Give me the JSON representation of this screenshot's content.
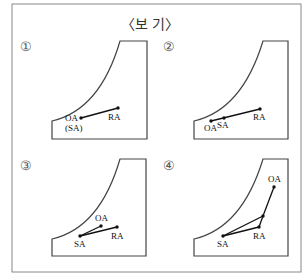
{
  "title": "〈보 기〉",
  "panels": [
    {
      "number": "①",
      "labels": {
        "oa": "OA",
        "sa": "(SA)",
        "ra": "RA"
      },
      "points": {
        "OA": [
          81,
          118
        ],
        "RA": [
          118,
          108
        ]
      }
    },
    {
      "number": "②",
      "labels": {
        "oa": "OA",
        "sa": "SA",
        "ra": "RA"
      },
      "points": {
        "OA": [
          211,
          121
        ],
        "SA": [
          224,
          118
        ],
        "RA": [
          260,
          109
        ]
      }
    },
    {
      "number": "③",
      "labels": {
        "oa": "OA",
        "sa": "SA",
        "ra": "RA"
      },
      "points": {
        "SA": [
          80,
          236
        ],
        "OA": [
          101,
          226
        ],
        "RA": [
          117,
          227
        ]
      }
    },
    {
      "number": "④",
      "labels": {
        "oa": "OA",
        "sa": "SA",
        "ra": "RA"
      },
      "points": {
        "OA": [
          274,
          187
        ],
        "MID": [
          263,
          216
        ],
        "RA": [
          259,
          227
        ],
        "SA": [
          223,
          236
        ]
      }
    }
  ]
}
